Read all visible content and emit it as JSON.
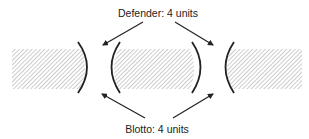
{
  "diagram": {
    "top_label": "Defender: 4 units",
    "bottom_label": "Blotto: 4 units",
    "colors": {
      "stroke": "#222222",
      "hatch": "#9a9a9a",
      "background": "#ffffff"
    },
    "regions": [
      {
        "name": "left-territory",
        "x": 12,
        "y": 49,
        "width": 72,
        "height": 40
      },
      {
        "name": "center-territory",
        "x": 113,
        "y": 49,
        "width": 82,
        "height": 40
      },
      {
        "name": "right-territory",
        "x": 230,
        "y": 49,
        "width": 72,
        "height": 40
      }
    ],
    "gaps": [
      {
        "name": "left-gap",
        "arcs": [
          "bulge-right",
          "bulge-left"
        ]
      },
      {
        "name": "right-gap",
        "arcs": [
          "bulge-right",
          "bulge-left"
        ]
      }
    ],
    "arrows": [
      {
        "from_label": "Defender: 4 units",
        "target": "left-gap"
      },
      {
        "from_label": "Defender: 4 units",
        "target": "right-gap"
      },
      {
        "from_label": "Blotto: 4 units",
        "target": "left-gap"
      },
      {
        "from_label": "Blotto: 4 units",
        "target": "right-gap"
      }
    ]
  }
}
